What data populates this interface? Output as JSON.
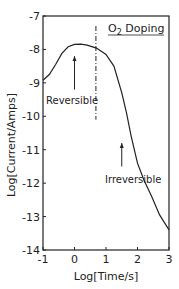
{
  "chart_data": {
    "type": "line",
    "title": "O2 Doping",
    "title_main": "O",
    "title_sub": "2",
    "title_rest": " Doping",
    "xlabel": "Log[Time/s]",
    "ylabel": "Log[Current/Amps]",
    "xlim": [
      -1,
      3
    ],
    "ylim": [
      -14,
      -7
    ],
    "xticks": [
      "-1",
      "0",
      "1",
      "2",
      "3"
    ],
    "yticks": [
      "-7",
      "-8",
      "-9",
      "-10",
      "-11",
      "-12",
      "-13",
      "-14"
    ],
    "grid": false,
    "series": [
      {
        "name": "current",
        "x": [
          -1.0,
          -0.8,
          -0.6,
          -0.4,
          -0.2,
          0.0,
          0.2,
          0.4,
          0.7,
          1.0,
          1.25,
          1.5,
          1.65,
          1.8,
          2.0,
          2.2,
          2.45,
          2.7,
          3.0
        ],
        "y": [
          -8.92,
          -8.75,
          -8.45,
          -8.12,
          -7.92,
          -7.85,
          -7.84,
          -7.87,
          -7.96,
          -8.15,
          -8.5,
          -9.3,
          -9.9,
          -10.6,
          -11.4,
          -11.9,
          -12.4,
          -12.95,
          -13.4
        ]
      }
    ],
    "annotations": [
      {
        "text": "Reversible",
        "arrow_x": 0.0,
        "arrow_from_y": -9.2,
        "arrow_to_y": -8.2
      },
      {
        "text": "Irreversible",
        "arrow_x": 1.5,
        "arrow_from_y": -11.5,
        "arrow_to_y": -10.8
      }
    ],
    "vline": {
      "x": 0.68,
      "style": "dash-dot",
      "y_from": -7.3,
      "y_to": -10.1
    }
  }
}
